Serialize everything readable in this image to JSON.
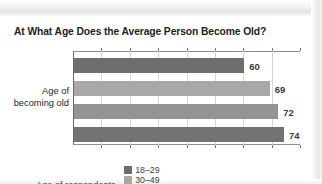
{
  "chart_data": {
    "type": "bar",
    "orientation": "horizontal",
    "title": "At What Age Does the Average Person Become Old?",
    "xlabel": "",
    "ylabel": "Age of becoming old",
    "ylabel_line1": "Age of",
    "ylabel_line2": "becoming old",
    "categories": [
      "Age of becoming old"
    ],
    "grid": true,
    "grid_axis": "x",
    "xlim": [
      0,
      80
    ],
    "axis_tick_count": 8,
    "tick_labels_visible": false,
    "legend_position": "bottom",
    "legend_title": "Age of respondents",
    "series": [
      {
        "name": "18–29",
        "values": [
          60
        ],
        "label": "60",
        "color": "#6e6e6e"
      },
      {
        "name": "30–49",
        "values": [
          69
        ],
        "label": "69",
        "color": "#a8a8a8"
      },
      {
        "name": "50–64",
        "values": [
          72
        ],
        "label": "72",
        "color": "#949494"
      },
      {
        "name": "65+",
        "values": [
          74
        ],
        "label": "74",
        "color": "#737373"
      }
    ]
  },
  "legend": {
    "title": "Age of respondents",
    "items": [
      {
        "label": "18–29",
        "color": "#6e6e6e"
      },
      {
        "label": "30–49",
        "color": "#a8a8a8"
      },
      {
        "label": "50–64",
        "color": "#949494"
      },
      {
        "label": "65+",
        "color": "#737373"
      }
    ]
  },
  "colors": {
    "title_text": "#231f20",
    "value_text": "#3a3a3a",
    "axis": "#6a6a6a",
    "gridline": "#d6d6d6",
    "background": "#ffffff"
  }
}
